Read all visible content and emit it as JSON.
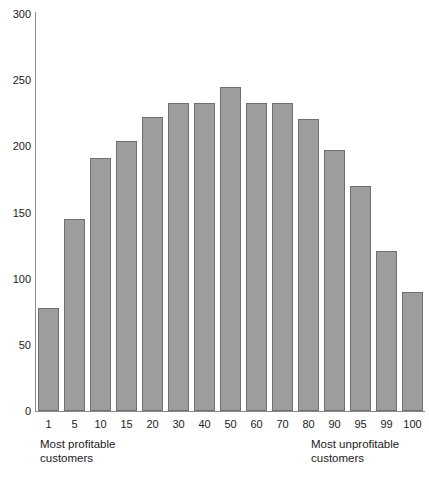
{
  "chart_data": {
    "type": "bar",
    "title": "",
    "xlabel": "",
    "ylabel": "",
    "categories": [
      "1",
      "5",
      "10",
      "15",
      "20",
      "30",
      "40",
      "50",
      "60",
      "70",
      "80",
      "90",
      "95",
      "99",
      "100"
    ],
    "values": [
      78,
      145,
      191,
      204,
      222,
      233,
      233,
      245,
      233,
      233,
      221,
      197,
      170,
      121,
      90
    ],
    "ylim": [
      0,
      300
    ],
    "yticks": [
      0,
      50,
      100,
      150,
      200,
      250,
      300
    ],
    "ytick_labels": [
      "0",
      "50",
      "100",
      "150",
      "200",
      "250",
      "300"
    ],
    "grid": false,
    "legend": "none",
    "bar_color": "#9d9d9d",
    "bar_border_color": "#707070",
    "axis_color": "#8a8a8a"
  },
  "annotations": {
    "left_caption_line1": "Most profitable",
    "left_caption_line2": "customers",
    "right_caption_line1": "Most unprofitable",
    "right_caption_line2": "customers"
  }
}
